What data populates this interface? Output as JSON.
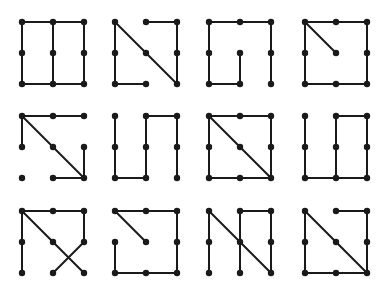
{
  "figure": {
    "grid": {
      "columns_x": [
        22,
        115,
        209,
        305
      ],
      "rows_y": [
        22,
        116,
        211
      ],
      "spacing": 31
    },
    "colors": {
      "line": "#1a1a1a",
      "dot": "#1a1a1a",
      "background": "#ffffff"
    },
    "patterns": [
      {
        "row": 0,
        "col": 0,
        "segments": [
          [
            0,
            0,
            2,
            0
          ],
          [
            0,
            2,
            2,
            2
          ],
          [
            0,
            0,
            0,
            2
          ],
          [
            1,
            0,
            1,
            2
          ],
          [
            2,
            0,
            2,
            2
          ]
        ]
      },
      {
        "row": 0,
        "col": 1,
        "segments": [
          [
            0,
            0,
            0,
            2
          ],
          [
            0,
            2,
            1,
            2
          ],
          [
            0,
            0,
            2,
            2
          ],
          [
            2,
            0,
            2,
            2
          ],
          [
            1,
            0,
            2,
            0
          ]
        ]
      },
      {
        "row": 0,
        "col": 2,
        "segments": [
          [
            0,
            0,
            2,
            0
          ],
          [
            0,
            0,
            0,
            2
          ],
          [
            0,
            2,
            1,
            2
          ],
          [
            1,
            1,
            1,
            2
          ],
          [
            2,
            0,
            2,
            2
          ]
        ]
      },
      {
        "row": 0,
        "col": 3,
        "segments": [
          [
            0,
            0,
            2,
            0
          ],
          [
            0,
            0,
            0,
            2
          ],
          [
            0,
            2,
            2,
            2
          ],
          [
            2,
            0,
            2,
            2
          ],
          [
            0,
            0,
            1,
            1
          ]
        ]
      },
      {
        "row": 1,
        "col": 0,
        "segments": [
          [
            0,
            0,
            2,
            0
          ],
          [
            0,
            0,
            0,
            1
          ],
          [
            0,
            0,
            2,
            2
          ],
          [
            2,
            1,
            2,
            2
          ],
          [
            1,
            2,
            2,
            2
          ]
        ]
      },
      {
        "row": 1,
        "col": 1,
        "segments": [
          [
            0,
            0,
            0,
            2
          ],
          [
            0,
            2,
            1,
            2
          ],
          [
            1,
            0,
            1,
            2
          ],
          [
            1,
            0,
            2,
            0
          ],
          [
            2,
            0,
            2,
            2
          ]
        ]
      },
      {
        "row": 1,
        "col": 2,
        "segments": [
          [
            0,
            0,
            2,
            0
          ],
          [
            0,
            0,
            0,
            2
          ],
          [
            0,
            2,
            2,
            2
          ],
          [
            2,
            0,
            2,
            2
          ],
          [
            0,
            0,
            2,
            2
          ]
        ]
      },
      {
        "row": 1,
        "col": 3,
        "segments": [
          [
            0,
            0,
            0,
            2
          ],
          [
            0,
            2,
            2,
            2
          ],
          [
            1,
            0,
            1,
            2
          ],
          [
            1,
            0,
            2,
            0
          ],
          [
            2,
            0,
            2,
            2
          ]
        ]
      },
      {
        "row": 2,
        "col": 0,
        "segments": [
          [
            0,
            0,
            2,
            0
          ],
          [
            0,
            0,
            0,
            2
          ],
          [
            0,
            0,
            2,
            2
          ],
          [
            2,
            0,
            2,
            1
          ],
          [
            2,
            1,
            1,
            2
          ]
        ]
      },
      {
        "row": 2,
        "col": 1,
        "segments": [
          [
            0,
            0,
            2,
            0
          ],
          [
            0,
            0,
            1,
            1
          ],
          [
            2,
            0,
            2,
            2
          ],
          [
            0,
            2,
            2,
            2
          ],
          [
            0,
            1,
            0,
            2
          ]
        ]
      },
      {
        "row": 2,
        "col": 2,
        "segments": [
          [
            0,
            0,
            0,
            2
          ],
          [
            0,
            0,
            2,
            2
          ],
          [
            1,
            0,
            1,
            2
          ],
          [
            1,
            0,
            2,
            0
          ],
          [
            2,
            0,
            2,
            2
          ]
        ]
      },
      {
        "row": 2,
        "col": 3,
        "segments": [
          [
            0,
            0,
            0,
            2
          ],
          [
            0,
            2,
            2,
            2
          ],
          [
            0,
            0,
            2,
            2
          ],
          [
            2,
            0,
            2,
            2
          ],
          [
            1,
            0,
            2,
            0
          ]
        ]
      }
    ]
  }
}
